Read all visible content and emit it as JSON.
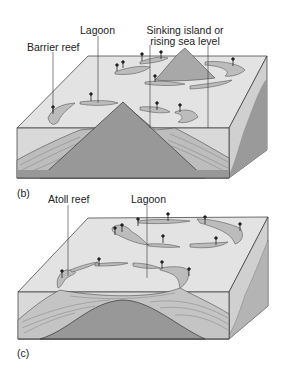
{
  "panel_b": {
    "letter": "(b)",
    "labels": {
      "barrier_reef": "Barrier reef",
      "lagoon": "Lagoon",
      "sinking_line1": "Sinking island or",
      "sinking_line2": "rising sea level"
    }
  },
  "panel_c": {
    "letter": "(c)",
    "labels": {
      "atoll_reef": "Atoll reef",
      "lagoon": "Lagoon"
    }
  },
  "colors": {
    "water_top": "#e3e3e3",
    "water_front": "#d9d9d9",
    "side": "#c8c8c8",
    "rock": "#989898",
    "reef": "#b9b9b9",
    "line": "#333333"
  }
}
